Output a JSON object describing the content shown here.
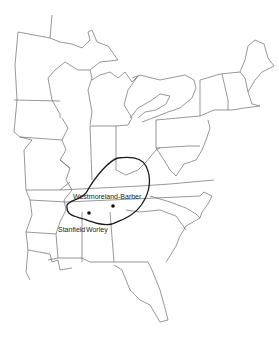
{
  "map": {
    "type": "range-map",
    "region": "Eastern United States",
    "range_outline_color": "#1a1a1a",
    "border_color": "#6b6b6b",
    "background": "#ffffff"
  },
  "labels": {
    "westmoreland_barber": "Westmoreland-Barber",
    "stanfield": "Stanfield",
    "worley": "Worley"
  },
  "points": [
    {
      "name": "Westmoreland-Barber",
      "x": 113,
      "y": 206
    },
    {
      "name": "Stanfield / Worley",
      "x": 89,
      "y": 213
    }
  ]
}
